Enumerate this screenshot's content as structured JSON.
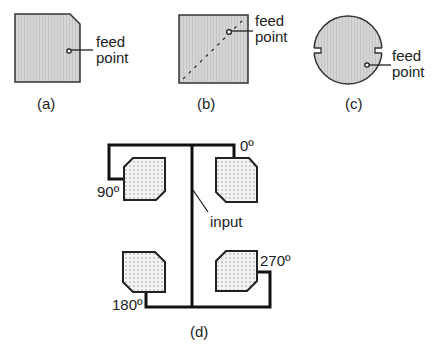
{
  "figure": {
    "panels": [
      {
        "id": "a",
        "caption": "(a)",
        "shape": "square patch with one truncated corner",
        "feed_label_line1": "feed",
        "feed_label_line2": "point"
      },
      {
        "id": "b",
        "caption": "(b)",
        "shape": "square patch with diagonal dashed line",
        "feed_label_line1": "feed",
        "feed_label_line2": "point"
      },
      {
        "id": "c",
        "caption": "(c)",
        "shape": "circular patch with two notches",
        "feed_label_line1": "feed",
        "feed_label_line2": "point"
      },
      {
        "id": "d",
        "caption": "(d)",
        "shape": "2x2 sequentially rotated truncated-corner patch array",
        "input_label": "input",
        "phases": {
          "top_right": "0º",
          "top_left": "90º",
          "bottom_left": "180º",
          "bottom_right": "270º"
        }
      }
    ]
  },
  "colors": {
    "patch_fill": "#d8d8d8",
    "dotted_patch_fill": "#f2f2f2",
    "stroke": "#1a1a1a"
  }
}
